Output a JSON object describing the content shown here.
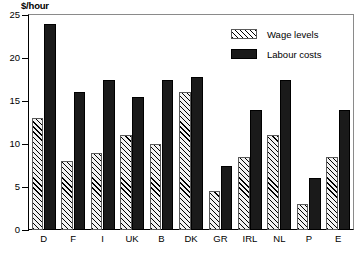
{
  "chart_data": {
    "type": "bar",
    "title": "$/hour",
    "xlabel": "",
    "ylabel": "$/hour",
    "ylim": [
      0,
      25
    ],
    "yticks": [
      0,
      5,
      10,
      15,
      20,
      25
    ],
    "grid": false,
    "legend_position": "top-right",
    "categories": [
      "D",
      "F",
      "I",
      "UK",
      "B",
      "DK",
      "GR",
      "IRL",
      "NL",
      "P",
      "E"
    ],
    "series": [
      {
        "name": "Wage levels",
        "pattern": "diagonal-hatch",
        "color": "#ffffff",
        "values": [
          13.0,
          8.0,
          9.0,
          11.0,
          10.0,
          16.0,
          4.5,
          8.5,
          11.0,
          3.0,
          8.5
        ]
      },
      {
        "name": "Labour costs",
        "pattern": "solid",
        "color": "#1a1a1a",
        "values": [
          24.0,
          16.0,
          17.5,
          15.5,
          17.5,
          17.8,
          7.5,
          14.0,
          17.5,
          6.0,
          14.0
        ]
      }
    ]
  },
  "legend": {
    "items": [
      {
        "label": "Wage levels",
        "swatch": "hatched-swatch"
      },
      {
        "label": "Labour costs",
        "swatch": "solid-black-swatch"
      }
    ]
  }
}
